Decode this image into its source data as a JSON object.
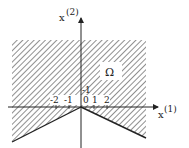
{
  "figure": {
    "type": "region-diagram",
    "region_label": "Ω",
    "axes": {
      "x_axis_label": "x",
      "x_axis_superscript": "(1)",
      "y_axis_label": "x",
      "y_axis_superscript": "(2)"
    },
    "ticks": {
      "x": [
        "-2",
        "-1",
        "0",
        "1",
        "2"
      ],
      "y": [
        "-1"
      ]
    },
    "colors": {
      "line": "#222222",
      "hatch": "#333333",
      "background": "#ffffff"
    }
  }
}
